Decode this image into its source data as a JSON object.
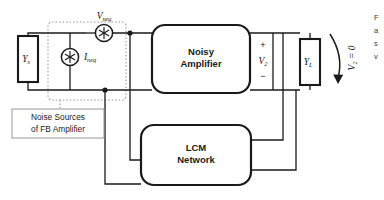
{
  "figure": {
    "blocks": {
      "noisy_amplifier_line1": "Noisy",
      "noisy_amplifier_line2": "Amplifier",
      "lcm_line1": "LCM",
      "lcm_line2": "Network"
    },
    "caption_box": {
      "line1": "Noise Sources",
      "line2": "of FB Amplifier"
    },
    "labels": {
      "source_admittance": "Y",
      "source_admittance_sub": "s",
      "load_admittance": "Y",
      "load_admittance_sub": "L",
      "noise_voltage": "V",
      "noise_voltage_sub": "neq",
      "noise_current": "I",
      "noise_current_sub": "neq",
      "output_voltage": "V",
      "output_voltage_sub": "2",
      "plus_sign": "+",
      "minus_sign": "−",
      "annotation": "V₂ = 0"
    },
    "side_caption": {
      "line1": "F",
      "line2": "a",
      "line3": "s",
      "line4": "v"
    },
    "icons": {
      "noise_source_symbol": "asterisk-in-circle",
      "curved_arrow": "curved-arrow-down"
    },
    "colors": {
      "wire": "#1a1a1a",
      "block_border": "#1a1a1a",
      "dashed_border": "#9a9a9a",
      "caption_border": "#8c8c8c",
      "background": "#ffffff"
    }
  }
}
